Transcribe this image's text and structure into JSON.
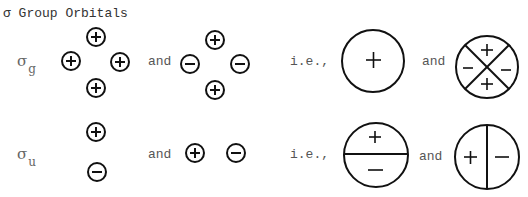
{
  "title": "σ Group  Orbitals",
  "rows": [
    {
      "label": {
        "symbol": "σ",
        "subscript": "g"
      },
      "and_1": "and",
      "ie": "i.e.,",
      "and_2": "and",
      "small_orbitals_set1": [
        {
          "pos": "top",
          "sign": "+"
        },
        {
          "pos": "left",
          "sign": "+"
        },
        {
          "pos": "right",
          "sign": "+"
        },
        {
          "pos": "bottom",
          "sign": "+"
        }
      ],
      "small_orbitals_set2": [
        {
          "pos": "top",
          "sign": "+"
        },
        {
          "pos": "left",
          "sign": "−"
        },
        {
          "pos": "right",
          "sign": "−"
        },
        {
          "pos": "bottom",
          "sign": "+"
        }
      ],
      "large_orbital_1": {
        "type": "single-lobe",
        "signs": [
          "+"
        ]
      },
      "large_orbital_2": {
        "type": "four-lobe-x",
        "signs": {
          "top": "+",
          "left": "−",
          "right": "−",
          "bottom": "+"
        }
      }
    },
    {
      "label": {
        "symbol": "σ",
        "subscript": "u"
      },
      "and_1": "and",
      "ie": "i.e.,",
      "and_2": "and",
      "small_orbitals_set1": [
        {
          "pos": "top",
          "sign": "+"
        },
        {
          "pos": "bottom",
          "sign": "−"
        }
      ],
      "small_orbitals_set2": [
        {
          "pos": "left",
          "sign": "+"
        },
        {
          "pos": "right",
          "sign": "−"
        }
      ],
      "large_orbital_1": {
        "type": "horizontal-split",
        "signs": {
          "top": "+",
          "bottom": "−"
        }
      },
      "large_orbital_2": {
        "type": "vertical-split",
        "signs": {
          "left": "+",
          "right": "−"
        }
      }
    }
  ],
  "colors": {
    "stroke": "#111111",
    "text": "#555555"
  }
}
